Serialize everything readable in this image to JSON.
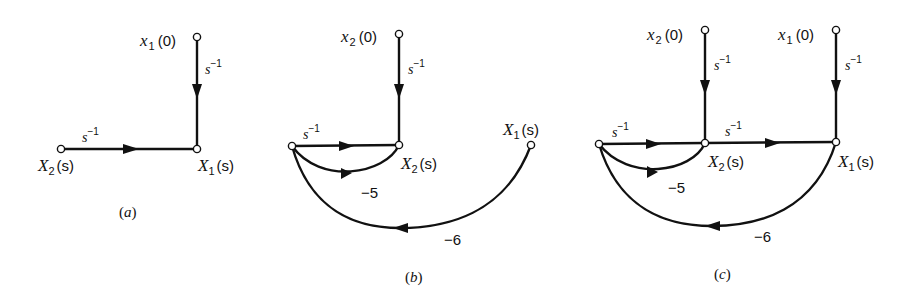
{
  "figure": {
    "panels": [
      {
        "caption_open": "(",
        "caption_letter": "a",
        "caption_close": ")",
        "nodes": {
          "x1_0": {
            "main": "x",
            "sub": "1",
            "arg": "(0)"
          },
          "X1_s": {
            "main": "X",
            "sub": "1",
            "arg": "(s)"
          },
          "X2_s": {
            "main": "X",
            "sub": "2",
            "arg": "(s)"
          }
        },
        "edges": [
          {
            "from": "x1(0)",
            "to": "X1(s)",
            "gain_base": "s",
            "gain_exp": "−1"
          },
          {
            "from": "X2(s)",
            "to": "X1(s)",
            "gain_base": "s",
            "gain_exp": "−1"
          }
        ]
      },
      {
        "caption_open": "(",
        "caption_letter": "b",
        "caption_close": ")",
        "nodes": {
          "x2_0": {
            "main": "x",
            "sub": "2",
            "arg": "(0)"
          },
          "X2_s": {
            "main": "X",
            "sub": "2",
            "arg": "(s)"
          },
          "X1_s": {
            "main": "X",
            "sub": "1",
            "arg": "(s)"
          }
        },
        "edges": [
          {
            "from": "x2(0)",
            "to": "X2(s)",
            "gain_base": "s",
            "gain_exp": "−1"
          },
          {
            "from": "sX2",
            "to": "X2(s)",
            "gain_base": "s",
            "gain_exp": "−1"
          },
          {
            "from": "X2(s)",
            "to": "sX2",
            "gain": "−5"
          },
          {
            "from": "X1(s)",
            "to": "sX2",
            "gain": "−6"
          }
        ]
      },
      {
        "caption_open": "(",
        "caption_letter": "c",
        "caption_close": ")",
        "nodes": {
          "x2_0": {
            "main": "x",
            "sub": "2",
            "arg": "(0)"
          },
          "x1_0": {
            "main": "x",
            "sub": "1",
            "arg": "(0)"
          },
          "X2_s": {
            "main": "X",
            "sub": "2",
            "arg": "(s)"
          },
          "X1_s": {
            "main": "X",
            "sub": "1",
            "arg": "(s)"
          }
        },
        "edges": [
          {
            "from": "x2(0)",
            "to": "X2(s)",
            "gain_base": "s",
            "gain_exp": "−1"
          },
          {
            "from": "x1(0)",
            "to": "X1(s)",
            "gain_base": "s",
            "gain_exp": "−1"
          },
          {
            "from": "sX2",
            "to": "X2(s)",
            "gain_base": "s",
            "gain_exp": "−1"
          },
          {
            "from": "X2(s)",
            "to": "X1(s)",
            "gain_base": "s",
            "gain_exp": "−1"
          },
          {
            "from": "X2(s)",
            "to": "sX2",
            "gain": "−5"
          },
          {
            "from": "X1(s)",
            "to": "sX2",
            "gain": "−6"
          }
        ]
      }
    ]
  }
}
